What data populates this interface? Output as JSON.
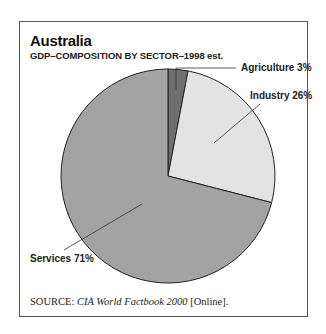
{
  "title": "Australia",
  "subtitle": "GDP–COMPOSITION BY SECTOR–1998 est.",
  "labels": {
    "agriculture": "Agriculture 3%",
    "industry": "Industry 26%",
    "services": "Services 71%"
  },
  "source": {
    "prefix": "SOURCE:",
    "title": "CIA World Factbook 2000",
    "suffix": "[Online]."
  },
  "colors": {
    "agriculture": "#6f6f6f",
    "industry": "#e3e3e3",
    "services": "#a3a3a3"
  },
  "chart_data": {
    "type": "pie",
    "title": "Australia",
    "subtitle": "GDP–COMPOSITION BY SECTOR–1998 est.",
    "categories": [
      "Agriculture",
      "Industry",
      "Services"
    ],
    "values": [
      3,
      26,
      71
    ],
    "unit": "%",
    "legend": "none (direct labels with leader lines)",
    "source": "CIA World Factbook 2000 [Online]."
  }
}
